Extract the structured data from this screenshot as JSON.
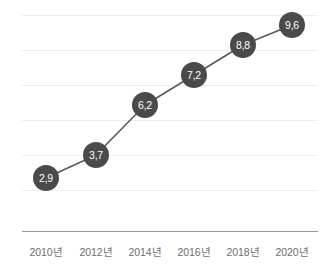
{
  "chart_data": {
    "type": "line",
    "title": "",
    "subtitle": "",
    "xlabel": "",
    "ylabel": "",
    "categories": [
      "2010년",
      "2012년",
      "2014년",
      "2016년",
      "2018년",
      "2020년"
    ],
    "values": [
      2.9,
      3.7,
      6.2,
      7.2,
      8.8,
      9.6
    ],
    "data_labels": [
      "2,9",
      "3,7",
      "6,2",
      "7,2",
      "8,8",
      "9,6"
    ],
    "decimal_separator": ",",
    "ylim": [
      0,
      11.5
    ],
    "grid": true,
    "gridlines_count": 6,
    "legend": [],
    "legend_position": "none",
    "annotations": [],
    "series": [
      {
        "name": "",
        "values": [
          2.9,
          3.7,
          6.2,
          7.2,
          8.8,
          9.6
        ]
      }
    ],
    "points": [
      {
        "category": "2010년",
        "value": 2.9,
        "label": "2,9",
        "px": 46,
        "py": 178
      },
      {
        "category": "2012년",
        "value": 3.7,
        "label": "3,7",
        "px": 96,
        "py": 155
      },
      {
        "category": "2014년",
        "value": 6.2,
        "label": "6,2",
        "px": 145,
        "py": 105
      },
      {
        "category": "2016년",
        "value": 7.2,
        "label": "7,2",
        "px": 194,
        "py": 75
      },
      {
        "category": "2018년",
        "value": 8.8,
        "label": "8,8",
        "px": 243,
        "py": 45
      },
      {
        "category": "2020년",
        "value": 9.6,
        "label": "9,6",
        "px": 292,
        "py": 25
      }
    ],
    "gridline_y": [
      15,
      50,
      85,
      120,
      155,
      190
    ],
    "axis_y": 231,
    "colors": {
      "marker_fill": "#4a4a4a",
      "marker_label": "#ffffff",
      "line": "#595959",
      "gridline": "#ededed",
      "axis_line": "#9a9a9a",
      "tick_label": "#6e6e6e",
      "background": "#ffffff"
    }
  }
}
